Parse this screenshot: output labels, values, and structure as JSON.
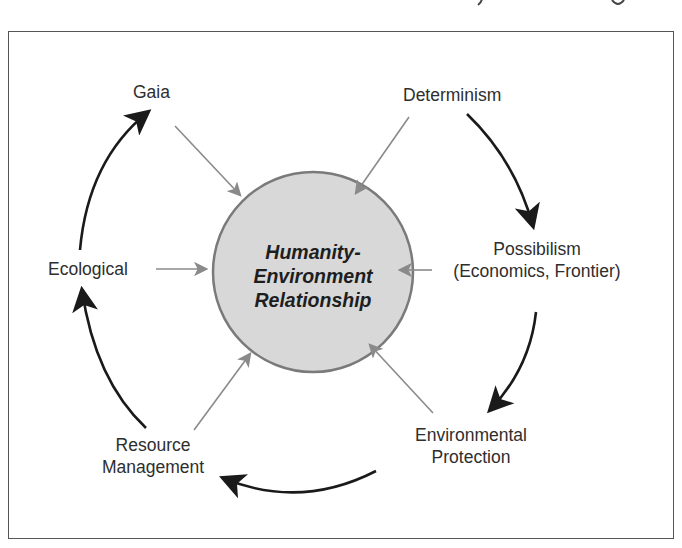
{
  "diagram": {
    "title_fragment_visible": "clipped text at top edge (unreadable)",
    "center": {
      "line1": "Humanity-",
      "line2": "Environment",
      "line3": "Relationship",
      "fill_color": "#d8d8d8",
      "stroke_color": "#7a7a7a"
    },
    "nodes": [
      {
        "id": "gaia",
        "lines": [
          "Gaia"
        ]
      },
      {
        "id": "determinism",
        "lines": [
          "Determinism"
        ]
      },
      {
        "id": "possibilism",
        "lines": [
          "Possibilism",
          "(Economics, Frontier)"
        ]
      },
      {
        "id": "environmental-protection",
        "lines": [
          "Environmental",
          "Protection"
        ]
      },
      {
        "id": "resource-management",
        "lines": [
          "Resource",
          "Management"
        ]
      },
      {
        "id": "ecological",
        "lines": [
          "Ecological"
        ]
      }
    ],
    "cycle_order": [
      "Determinism",
      "Possibilism",
      "Environmental Protection",
      "Resource Management",
      "Ecological",
      "Gaia"
    ],
    "colors": {
      "cycle_arrow": "#1a1a1a",
      "influence_arrow": "#8a8a8a",
      "frame": "#555555"
    }
  }
}
